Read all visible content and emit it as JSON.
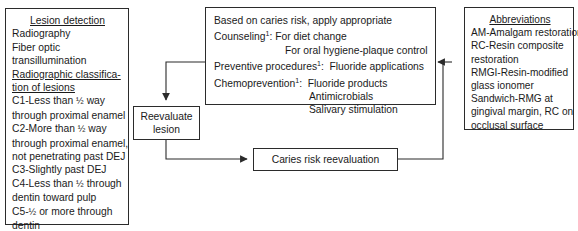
{
  "diagram": {
    "line_color": "#2b2b2b",
    "background": "#ffffff"
  },
  "lesion_detection": {
    "heading": "Lesion detection",
    "items": [
      "Radiography",
      "Fiber optic",
      "transillumination"
    ],
    "classification_heading_line1": "Radiographic classifica-",
    "classification_heading_line2": "tion of lesions",
    "classes": [
      {
        "l1_a": "C1-Less than ",
        "frac": "1/2",
        "l1_b": " way",
        "l2": "through proximal enamel"
      },
      {
        "l1_a": "C2-More than ",
        "frac": "1/2",
        "l1_b": " way",
        "l2": "through proximal enamel,",
        "l3": "not penetrating past DEJ"
      },
      {
        "l1_a": "C3-Slightly past DEJ",
        "frac": "",
        "l1_b": ""
      },
      {
        "l1_a": "C4-Less than ",
        "frac": "1/2",
        "l1_b": " through",
        "l2": "dentin toward pulp"
      },
      {
        "l1_a": "C5-",
        "frac": "1/2",
        "l1_b": " or more through",
        "l2": "dentin"
      }
    ]
  },
  "caries_risk_plan": {
    "intro": "Based on caries risk, apply appropriate",
    "rows": [
      {
        "label": "Counseling",
        "sup": "1",
        "sep": ":",
        "values": [
          "For diet change",
          "For oral hygiene-plaque control"
        ]
      },
      {
        "label": "Preventive procedures",
        "sup": "1",
        "sep": ":",
        "values": [
          "Fluoride applications"
        ]
      },
      {
        "label": "Chemoprevention",
        "sup": "1",
        "sep": ":",
        "values": [
          "Fluoride products",
          "Antimicrobials",
          "Salivary stimulation"
        ]
      }
    ]
  },
  "reevaluate": {
    "line1": "Reevaluate",
    "line2": "lesion"
  },
  "caries_reevaluation": {
    "label": "Caries risk reevaluation"
  },
  "abbreviations": {
    "heading": "Abbreviations",
    "items": [
      "AM-Amalgam restoration",
      "RC-Resin composite",
      "restoration",
      "RMGI-Resin-modified",
      "glass ionomer",
      "Sandwich-RMG at",
      "gingival margin, RC on",
      "occlusal surface"
    ]
  }
}
